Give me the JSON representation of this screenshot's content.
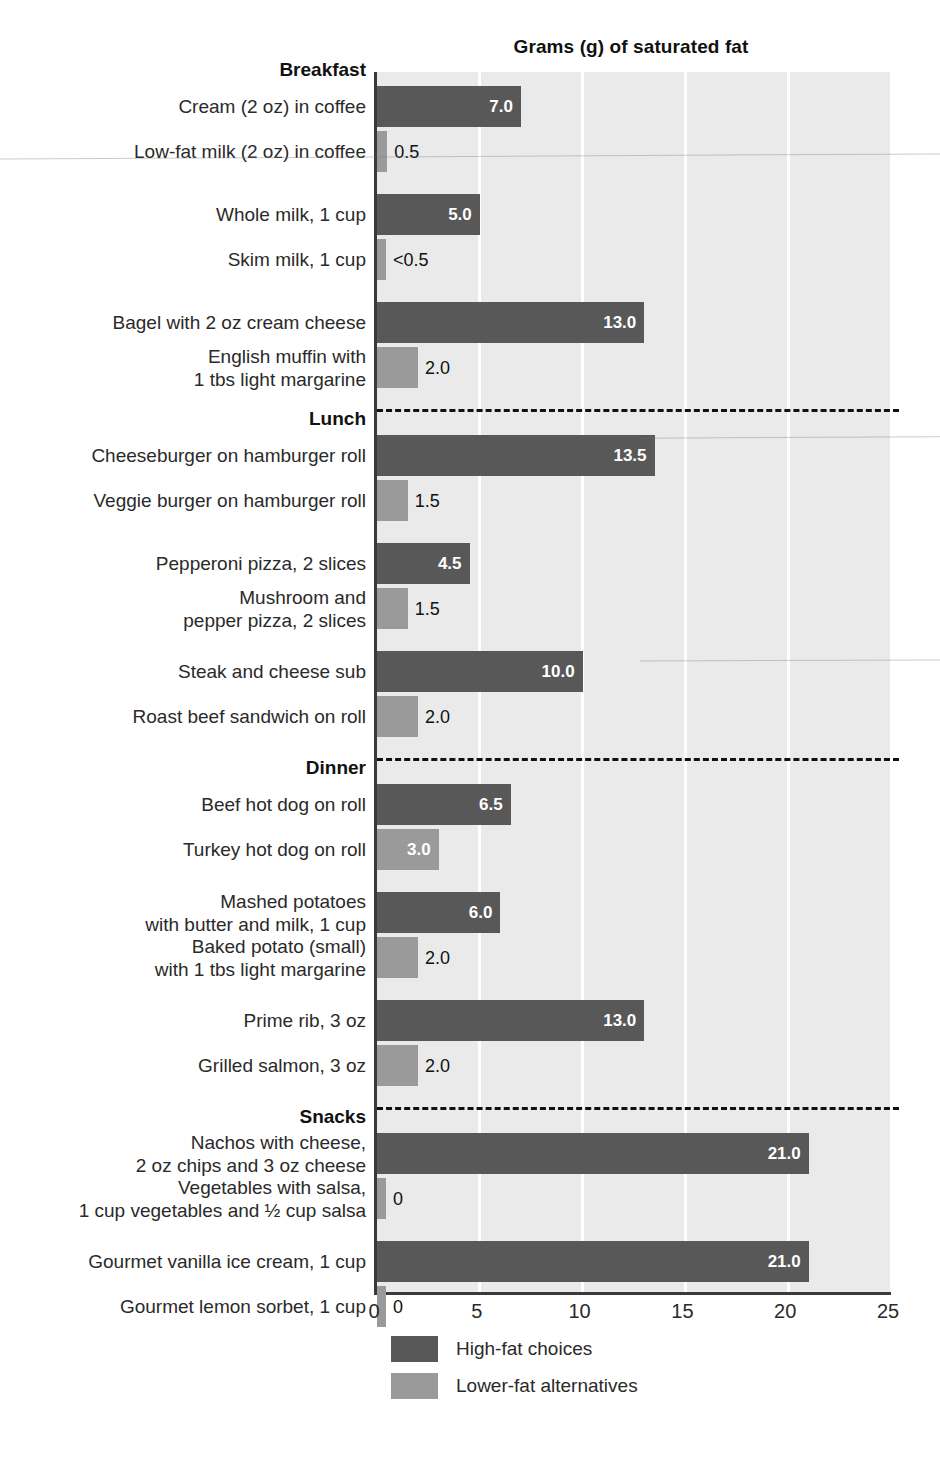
{
  "chart_data": {
    "type": "bar",
    "orientation": "horizontal",
    "title": "Grams (g) of saturated fat",
    "xlabel": "",
    "ylabel": "",
    "xlim": [
      0,
      25
    ],
    "xticks": [
      0,
      5,
      10,
      15,
      20,
      25
    ],
    "grid": "vertical-white-gridlines",
    "legend_position": "bottom-left",
    "series": [
      {
        "name": "High-fat choices",
        "color": "#585858"
      },
      {
        "name": "Lower-fat alternatives",
        "color": "#9a9a9a"
      }
    ],
    "groups": [
      {
        "group": "Breakfast",
        "pairs": [
          {
            "high": {
              "label": "Cream (2 oz) in coffee",
              "value": 7.0,
              "value_text": "7.0"
            },
            "low": {
              "label": "Low-fat milk (2 oz) in coffee",
              "value": 0.5,
              "value_text": "0.5"
            }
          },
          {
            "high": {
              "label": "Whole milk, 1 cup",
              "value": 5.0,
              "value_text": "5.0"
            },
            "low": {
              "label": "Skim milk, 1 cup",
              "value": 0.35,
              "value_text": "<0.5"
            }
          },
          {
            "high": {
              "label": "Bagel with 2 oz cream cheese",
              "value": 13.0,
              "value_text": "13.0"
            },
            "low": {
              "label": "English muffin with\n1 tbs light margarine",
              "value": 2.0,
              "value_text": "2.0"
            }
          }
        ]
      },
      {
        "group": "Lunch",
        "pairs": [
          {
            "high": {
              "label": "Cheeseburger on hamburger roll",
              "value": 13.5,
              "value_text": "13.5"
            },
            "low": {
              "label": "Veggie burger on hamburger roll",
              "value": 1.5,
              "value_text": "1.5"
            }
          },
          {
            "high": {
              "label": "Pepperoni pizza, 2 slices",
              "value": 4.5,
              "value_text": "4.5"
            },
            "low": {
              "label": "Mushroom and\npepper pizza, 2 slices",
              "value": 1.5,
              "value_text": "1.5"
            }
          },
          {
            "high": {
              "label": "Steak and cheese sub",
              "value": 10.0,
              "value_text": "10.0"
            },
            "low": {
              "label": "Roast beef sandwich on roll",
              "value": 2.0,
              "value_text": "2.0"
            }
          }
        ]
      },
      {
        "group": "Dinner",
        "pairs": [
          {
            "high": {
              "label": "Beef hot dog on roll",
              "value": 6.5,
              "value_text": "6.5"
            },
            "low": {
              "label": "Turkey hot dog on roll",
              "value": 3.0,
              "value_text": "3.0"
            }
          },
          {
            "high": {
              "label": "Mashed potatoes\nwith butter and milk, 1 cup",
              "value": 6.0,
              "value_text": "6.0"
            },
            "low": {
              "label": "Baked potato (small)\nwith 1 tbs light margarine",
              "value": 2.0,
              "value_text": "2.0"
            }
          },
          {
            "high": {
              "label": "Prime rib, 3 oz",
              "value": 13.0,
              "value_text": "13.0"
            },
            "low": {
              "label": "Grilled salmon, 3 oz",
              "value": 2.0,
              "value_text": "2.0"
            }
          }
        ]
      },
      {
        "group": "Snacks",
        "pairs": [
          {
            "high": {
              "label": "Nachos with cheese,\n2 oz chips and 3 oz cheese",
              "value": 21.0,
              "value_text": "21.0"
            },
            "low": {
              "label": "Vegetables with salsa,\n1 cup vegetables and ½ cup salsa",
              "value": 0,
              "value_text": "0"
            }
          },
          {
            "high": {
              "label": "Gourmet vanilla ice cream, 1 cup",
              "value": 21.0,
              "value_text": "21.0"
            },
            "low": {
              "label": "Gourmet lemon sorbet, 1 cup",
              "value": 0,
              "value_text": "0"
            }
          }
        ]
      }
    ]
  },
  "legend": {
    "items": [
      {
        "label": "High-fat choices",
        "swatch": "high"
      },
      {
        "label": "Lower-fat alternatives",
        "swatch": "low"
      }
    ]
  },
  "caption": ""
}
